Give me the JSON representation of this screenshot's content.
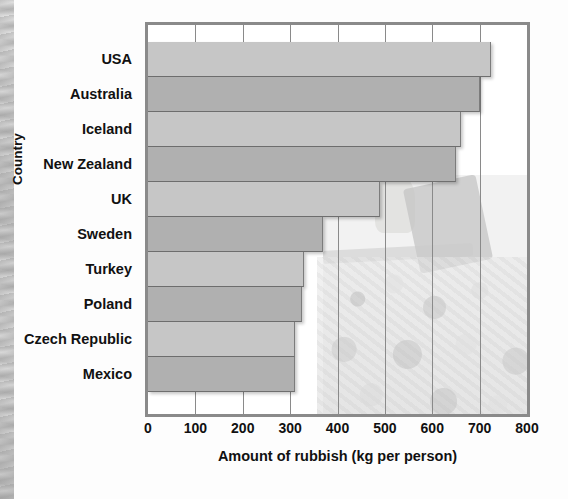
{
  "chart_data": {
    "type": "bar",
    "orientation": "horizontal",
    "title": "",
    "xlabel": "Amount of rubbish (kg per person)",
    "ylabel": "Country",
    "xlim": [
      0,
      800
    ],
    "xticks": [
      0,
      100,
      200,
      300,
      400,
      500,
      600,
      700,
      800
    ],
    "grid": true,
    "grid_axis": "x",
    "legend": "none",
    "categories": [
      "USA",
      "Australia",
      "Iceland",
      "New Zealand",
      "UK",
      "Sweden",
      "Turkey",
      "Poland",
      "Czech Republic",
      "Mexico"
    ],
    "values": [
      725,
      700,
      660,
      650,
      490,
      370,
      330,
      325,
      310,
      310
    ],
    "units": "kg per person",
    "bar_colors": [
      "#c6c6c6",
      "#b0b0b0"
    ],
    "background_image": "photograph of a pile of rubbish"
  },
  "axis": {
    "y_title": "Country",
    "x_title": "Amount of rubbish (kg per person)"
  },
  "frame": {
    "border_color": "#8a8a8a"
  }
}
